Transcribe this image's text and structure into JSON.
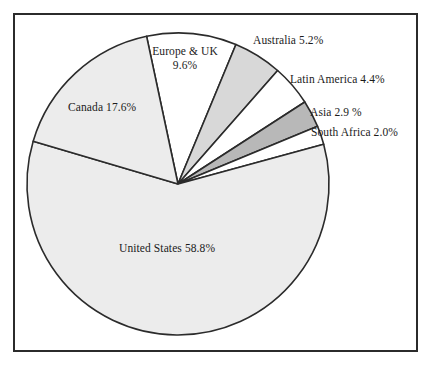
{
  "chart_data": {
    "type": "pie",
    "title": "",
    "subtitle": "",
    "xlabel": "",
    "ylabel": "",
    "legend_position": "none",
    "grid": false,
    "units": "percent",
    "categories": [
      "Europe & UK",
      "Australia",
      "Latin America",
      "Asia",
      "South Africa",
      "United States",
      "Canada"
    ],
    "values": [
      9.6,
      5.2,
      4.4,
      2.9,
      2.0,
      58.8,
      17.6
    ],
    "slices": [
      {
        "name": "Europe & UK",
        "value": 9.6,
        "label_line1": "Europe & UK",
        "label_line2": "9.6%",
        "label_text": "Europe & UK 9.6%",
        "fill": "#ffffff",
        "start_angle": -12.0,
        "end_angle": 22.56
      },
      {
        "name": "Australia",
        "value": 5.2,
        "label_line1": "Australia 5.2%",
        "label_line2": "",
        "label_text": "Australia 5.2%",
        "fill": "#d8d8d8",
        "start_angle": 22.56,
        "end_angle": 41.28
      },
      {
        "name": "Latin America",
        "value": 4.4,
        "label_line1": "Latin America 4.4%",
        "label_line2": "",
        "label_text": "Latin America 4.4%",
        "fill": "#ffffff",
        "start_angle": 41.28,
        "end_angle": 57.12
      },
      {
        "name": "Asia",
        "value": 2.9,
        "label_line1": "Asia 2.9 %",
        "label_line2": "",
        "label_text": "Asia 2.9 %",
        "fill": "#b8b8b8",
        "start_angle": 57.12,
        "end_angle": 67.56
      },
      {
        "name": "South Africa",
        "value": 2.0,
        "label_line1": "South Africa 2.0%",
        "label_line2": "",
        "label_text": "South Africa 2.0%",
        "fill": "#ffffff",
        "start_angle": 67.56,
        "end_angle": 74.76
      },
      {
        "name": "United States",
        "value": 58.8,
        "label_line1": "United States 58.8%",
        "label_line2": "",
        "label_text": "United States 58.8%",
        "fill": "#ececec",
        "start_angle": 74.76,
        "end_angle": 286.44
      },
      {
        "name": "Canada",
        "value": 17.6,
        "label_line1": "Canada 17.6%",
        "label_line2": "",
        "label_text": "Canada 17.6%",
        "fill": "#ececec",
        "start_angle": 286.44,
        "end_angle": 348.0
      }
    ],
    "colors": {
      "outline": "#2b2b2b",
      "frame": "#2b2b2b",
      "background": "#ffffff",
      "fill_light": "#ececec",
      "fill_medium": "#d8d8d8",
      "fill_dark": "#b8b8b8",
      "fill_white": "#ffffff"
    }
  }
}
